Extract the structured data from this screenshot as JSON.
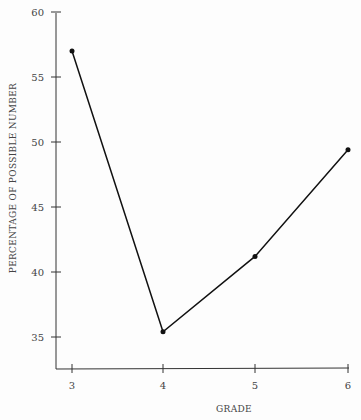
{
  "chart_data": {
    "type": "line",
    "title": "",
    "xlabel": "GRADE",
    "ylabel": "PERCENTAGE OF POSSIBLE NUMBER",
    "categories": [
      3,
      4,
      5,
      6
    ],
    "x_ticks": [
      "3",
      "4",
      "5",
      "6"
    ],
    "y_ticks": [
      "35",
      "40",
      "45",
      "50",
      "55",
      "60"
    ],
    "ylim": [
      32,
      60
    ],
    "series": [
      {
        "name": "Percentage",
        "values": [
          57.0,
          35.4,
          41.2,
          49.4
        ]
      }
    ],
    "grid": false,
    "legend": "none",
    "line_color": "#111111"
  }
}
